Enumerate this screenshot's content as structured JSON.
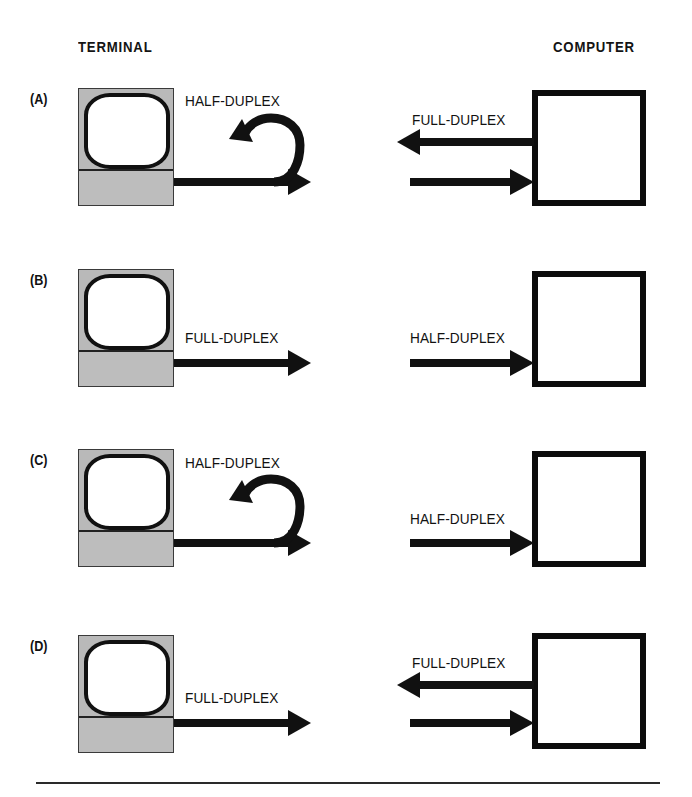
{
  "figure": {
    "headings": {
      "terminal": "TERMINAL",
      "computer": "COMPUTER"
    },
    "colors": {
      "ink": "#111111",
      "terminal_body": "#b9b9b9",
      "terminal_base": "#bdbdbd",
      "screen": "#ffffff",
      "box_border": "#0c0c0c",
      "rule": "#2a2a2a",
      "background": "#ffffff"
    },
    "panels": [
      {
        "label": "(A)",
        "terminal": {
          "link_label": "HALF-DUPLEX",
          "has_echo_loop": true,
          "arrows": [
            "right"
          ]
        },
        "computer": {
          "link_label": "FULL-DUPLEX",
          "has_echo_loop": false,
          "arrows": [
            "left",
            "right"
          ]
        }
      },
      {
        "label": "(B)",
        "terminal": {
          "link_label": "FULL-DUPLEX",
          "has_echo_loop": false,
          "arrows": [
            "right"
          ]
        },
        "computer": {
          "link_label": "HALF-DUPLEX",
          "has_echo_loop": false,
          "arrows": [
            "right"
          ]
        }
      },
      {
        "label": "(C)",
        "terminal": {
          "link_label": "HALF-DUPLEX",
          "has_echo_loop": true,
          "arrows": [
            "right"
          ]
        },
        "computer": {
          "link_label": "HALF-DUPLEX",
          "has_echo_loop": false,
          "arrows": [
            "right"
          ]
        }
      },
      {
        "label": "(D)",
        "terminal": {
          "link_label": "FULL-DUPLEX",
          "has_echo_loop": false,
          "arrows": [
            "right"
          ]
        },
        "computer": {
          "link_label": "FULL-DUPLEX",
          "has_echo_loop": false,
          "arrows": [
            "left",
            "right"
          ]
        }
      }
    ]
  }
}
